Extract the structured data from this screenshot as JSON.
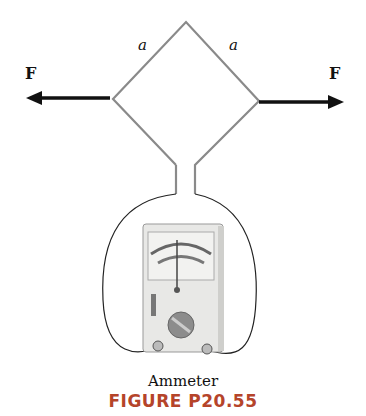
{
  "labels": {
    "force_left": "F",
    "force_right": "F",
    "side_left": "a",
    "side_right": "a",
    "meter": "Ammeter",
    "caption": "FIGURE P20.55"
  },
  "colors": {
    "loop": "#8a8a8a",
    "arrow": "#111111",
    "caption": "#b5442a",
    "meter_body": "#e8e8e6",
    "meter_face": "#f2f2f0",
    "dial": "#8c8c8c"
  }
}
